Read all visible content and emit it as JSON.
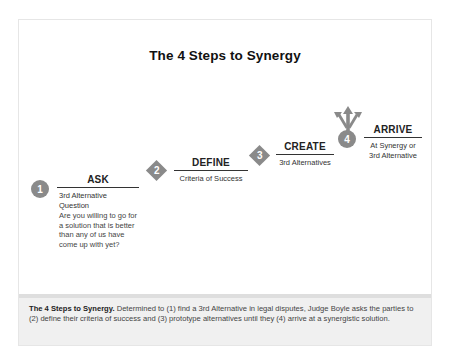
{
  "title": "The 4 Steps to Synergy",
  "steps": [
    {
      "number": "1",
      "shape": "circle",
      "title": "ASK",
      "subtitle": "3rd Alternative Question",
      "body": "Are you willing to go for a solution that is better than any of us have come up with yet?"
    },
    {
      "number": "2",
      "shape": "diamond",
      "title": "DEFINE",
      "subtitle": "Criteria of Success"
    },
    {
      "number": "3",
      "shape": "diamond",
      "title": "CREATE",
      "subtitle": "3rd Alternatives"
    },
    {
      "number": "4",
      "shape": "circle-with-arrows",
      "title": "ARRIVE",
      "subtitle_line1": "At Synergy or",
      "subtitle_line2": "3rd Alternative"
    }
  ],
  "caption": {
    "bold": "The 4 Steps to Synergy.",
    "text": " Determined to (1) find a 3rd Alternative in legal disputes, Judge Boyle asks the parties to (2) define their criteria of success and (3) prototype alternatives until they (4) arrive at a synergistic solution."
  },
  "colors": {
    "marker": "#8a8a8a",
    "caption_bg": "#f0f0f0",
    "rule": "#333333"
  }
}
